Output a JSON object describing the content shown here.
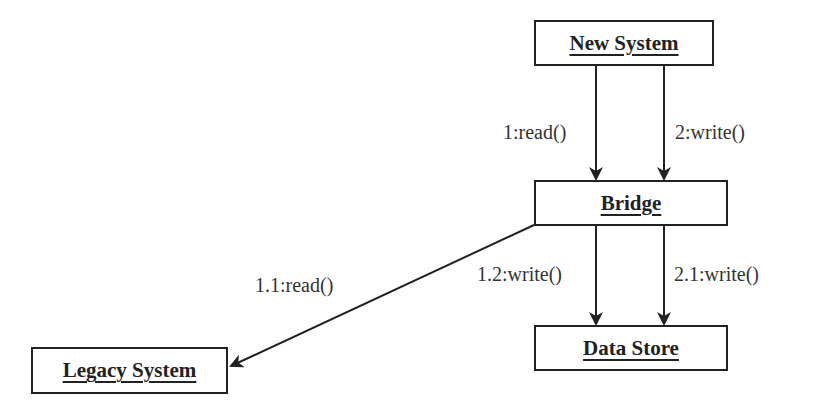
{
  "diagram": {
    "type": "UML collaboration diagram",
    "objects": [
      {
        "id": "new_system",
        "label": "New System"
      },
      {
        "id": "bridge",
        "label": "Bridge"
      },
      {
        "id": "data_store",
        "label": "Data Store"
      },
      {
        "id": "legacy_system",
        "label": "Legacy System"
      }
    ],
    "messages": [
      {
        "from": "new_system",
        "to": "bridge",
        "label": "1:read()"
      },
      {
        "from": "new_system",
        "to": "bridge",
        "label": "2:write()"
      },
      {
        "from": "bridge",
        "to": "legacy_system",
        "label": "1.1:read()"
      },
      {
        "from": "bridge",
        "to": "data_store",
        "label": "1.2:write()"
      },
      {
        "from": "bridge",
        "to": "data_store",
        "label": "2.1:write()"
      }
    ],
    "colors": {
      "stroke": "#222222",
      "text": "#333333",
      "background": "#ffffff"
    }
  }
}
